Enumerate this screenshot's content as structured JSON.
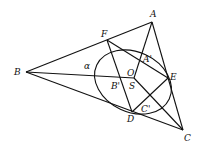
{
  "figure": {
    "type": "geometry-diagram",
    "stroke_color": "#111111",
    "background": "#ffffff"
  },
  "points": {
    "A": {
      "label": "A",
      "x": 152,
      "y": 22
    },
    "B": {
      "label": "B",
      "x": 26,
      "y": 72
    },
    "C": {
      "label": "C",
      "x": 183,
      "y": 130
    },
    "D": {
      "label": "D",
      "x": 132,
      "y": 112
    },
    "E": {
      "label": "E",
      "x": 168,
      "y": 78
    },
    "F": {
      "label": "F",
      "x": 107,
      "y": 40
    },
    "O": {
      "label": "O",
      "x": 134,
      "y": 78
    },
    "S": {
      "label": "S",
      "x": 133,
      "y": 79
    },
    "A1": {
      "label": "A'",
      "x": 144,
      "y": 58
    },
    "B1": {
      "label": "B'",
      "x": 122,
      "y": 80
    },
    "C1": {
      "label": "C'",
      "x": 150,
      "y": 103
    }
  },
  "conic": {
    "label": "α",
    "cx": 133,
    "cy": 82,
    "rx": 40,
    "ry": 30,
    "rotation": 25
  },
  "labels": {
    "A": "A",
    "B": "B",
    "C": "C",
    "D": "D",
    "E": "E",
    "F": "F",
    "O": "O",
    "S": "S",
    "A1": "A'",
    "B1": "B'",
    "C1": "C'",
    "alpha": "α"
  }
}
